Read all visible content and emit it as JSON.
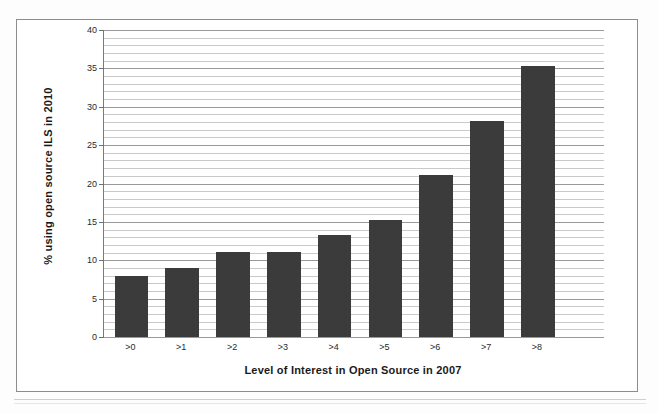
{
  "chart_data": {
    "type": "bar",
    "title": "",
    "xlabel": "Level of Interest in Open Source in 2007",
    "ylabel": "% using open source ILS in 2010",
    "categories": [
      ">0",
      ">1",
      ">2",
      ">3",
      ">4",
      ">5",
      ">6",
      ">7",
      ">8"
    ],
    "values": [
      8.0,
      9.0,
      11.1,
      11.1,
      13.3,
      15.2,
      21.1,
      28.2,
      35.3
    ],
    "ylim": [
      0,
      40
    ],
    "y_major_ticks": [
      0,
      5,
      10,
      15,
      20,
      25,
      30,
      35,
      40
    ],
    "y_tick_labels": [
      "0",
      "5",
      "10",
      "15",
      "20",
      "25",
      "30",
      "35",
      "40"
    ],
    "y_minor_step": 1,
    "grid": "horizontal-major-and-minor",
    "legend": "none",
    "series": [
      {
        "name": "% using open source ILS in 2010",
        "color": "#3b3b3b",
        "values": [
          8.0,
          9.0,
          11.1,
          11.1,
          13.3,
          15.2,
          21.1,
          28.2,
          35.3
        ]
      }
    ]
  },
  "colors": {
    "bar": "#3b3b3b",
    "axis": "#7a7a7a",
    "gridline_minor": "#c9c9c9",
    "gridline_major": "#9a9a9a",
    "text": "#1a1a1a",
    "frame": "#8d8d8d",
    "background": "#ffffff"
  }
}
